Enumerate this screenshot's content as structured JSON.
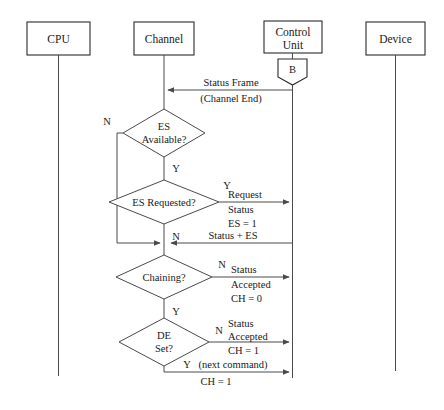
{
  "diagram": {
    "lanes": [
      {
        "id": "cpu",
        "label": "CPU"
      },
      {
        "id": "channel",
        "label": "Channel"
      },
      {
        "id": "control_unit",
        "label": "Control Unit"
      },
      {
        "id": "device",
        "label": "Device"
      }
    ],
    "control_unit_marker": {
      "label": "B"
    },
    "decisions": [
      {
        "id": "es_available",
        "line1": "ES",
        "line2": "Available?",
        "yes": "Y",
        "no": "N"
      },
      {
        "id": "es_requested",
        "line1": "ES Requested?",
        "line2": "",
        "yes": "Y",
        "no": "N"
      },
      {
        "id": "chaining",
        "line1": "Chaining?",
        "line2": "",
        "yes": "Y",
        "no": "N"
      },
      {
        "id": "de_set",
        "line1": "DE",
        "line2": "Set?",
        "yes": "Y",
        "no": "N"
      }
    ],
    "messages": [
      {
        "id": "status_frame",
        "direction": "control-unit-to-channel",
        "above": "Status Frame",
        "below": "(Channel End)"
      },
      {
        "id": "request_status",
        "direction": "channel-to-control-unit",
        "line1": "Request",
        "line2": "Status",
        "line3": "ES = 1"
      },
      {
        "id": "status_plus_es",
        "direction": "control-unit-to-channel",
        "line1": "Status + ES"
      },
      {
        "id": "status_accepted_ch0",
        "direction": "channel-to-control-unit",
        "line1": "Status",
        "line2": "Accepted",
        "line3": "CH = 0"
      },
      {
        "id": "status_accepted_ch1",
        "direction": "channel-to-control-unit",
        "line1": "Status",
        "line2": "Accepted",
        "line3": "CH = 1"
      },
      {
        "id": "next_command_ch1",
        "direction": "channel-to-control-unit",
        "line1": "(next command)",
        "line2": "CH = 1"
      }
    ],
    "colors": {
      "stroke": "#4a4a4a",
      "box_stroke": "#2b2b2b",
      "text": "#1a1a1a",
      "background": "#ffffff"
    }
  }
}
